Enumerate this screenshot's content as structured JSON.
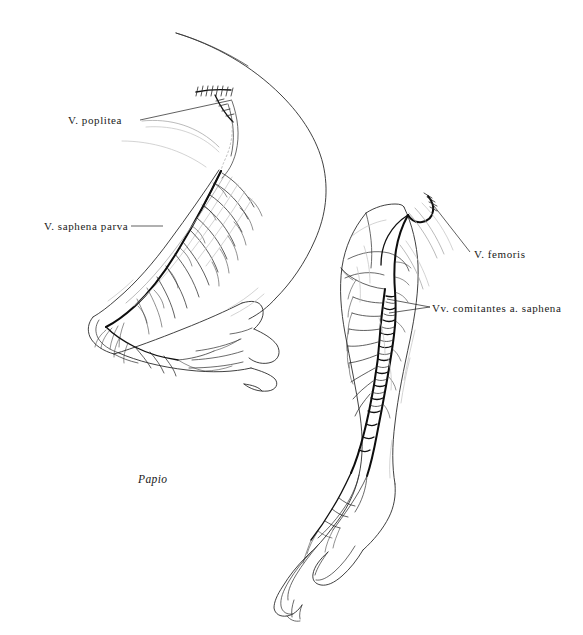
{
  "figure": {
    "subject_caption": "Papio",
    "background_color": "#ffffff",
    "ink_color": "#1a1a1a",
    "faint_ink_color": "#9a9a9a",
    "vessel_color": "#111111",
    "width": 583,
    "height": 635
  },
  "labels": [
    {
      "id": "poplitea",
      "text": "V. poplitea",
      "align": "left",
      "leader": {
        "x1": 140,
        "y1": 120,
        "x2": 232,
        "y2": 100
      }
    },
    {
      "id": "saphena_parva",
      "text": "V. saphena parva",
      "align": "left",
      "leader": {
        "x1": 131,
        "y1": 226,
        "x2": 163,
        "y2": 226
      }
    },
    {
      "id": "femoris",
      "text": "V. femoris",
      "align": "left",
      "leader": {
        "x1": 470,
        "y1": 252,
        "x2": 434,
        "y2": 206
      }
    },
    {
      "id": "comitantes",
      "text": "Vv. comitantes a. saphena",
      "align": "left",
      "leader": {
        "x1": 430,
        "y1": 307,
        "x2": 387,
        "y2": 299
      },
      "leader2": {
        "x1": 430,
        "y1": 307,
        "x2": 389,
        "y2": 313
      }
    }
  ],
  "specimens": [
    {
      "id": "left-limb",
      "name": "left hindlimb, lateral view",
      "vessels": [
        "V. poplitea",
        "V. saphena parva"
      ]
    },
    {
      "id": "right-limb",
      "name": "right hindlimb, medial view",
      "vessels": [
        "V. femoris",
        "Vv. comitantes a. saphena"
      ]
    }
  ]
}
